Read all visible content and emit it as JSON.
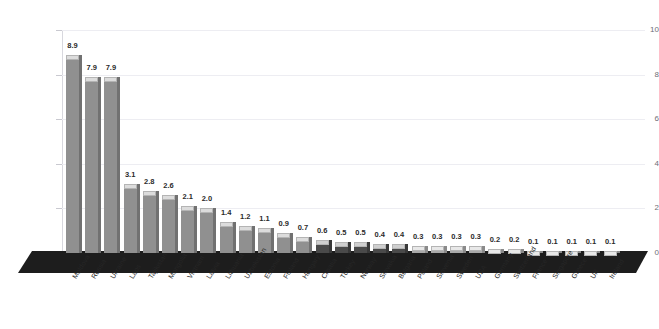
{
  "chart_data": {
    "type": "bar",
    "title": "",
    "subtitle": "",
    "xlabel": "",
    "ylabel": "",
    "ylim": [
      0,
      10
    ],
    "ytick_labels": [
      "0",
      "2",
      "4",
      "6",
      "8",
      "10"
    ],
    "ytick_values": [
      0,
      2,
      4,
      6,
      8,
      10
    ],
    "grid": true,
    "legend": "none",
    "style": "3d-isometric-column",
    "categories": [
      "Moldova",
      "Russia",
      "Ukraine",
      "Laos",
      "Tajikistan",
      "Mongolia",
      "Vietnam",
      "Latvia",
      "Lithuania",
      "Uzbekistan",
      "Estonia",
      "Finland",
      "Hungary",
      "Croatia",
      "Turkey",
      "Norway",
      "Slovakia",
      "Bulgaria",
      "Poland",
      "Slovenia",
      "Sweden",
      "USA",
      "Germany",
      "Switzerland",
      "France",
      "Singapore",
      "Greece",
      "UK",
      "Ireland"
    ],
    "values": [
      8.9,
      7.9,
      7.9,
      3.1,
      2.8,
      2.6,
      2.1,
      2.0,
      1.4,
      1.2,
      1.1,
      0.9,
      0.7,
      0.6,
      0.5,
      0.5,
      0.4,
      0.4,
      0.3,
      0.3,
      0.3,
      0.3,
      0.2,
      0.2,
      0.1,
      0.1,
      0.1,
      0.1,
      0.1
    ],
    "value_labels": [
      "8.9",
      "7.9",
      "7.9",
      "3.1",
      "2.8",
      "2.6",
      "2.1",
      "2.0",
      "1.4",
      "1.2",
      "1.1",
      "0.9",
      "0.7",
      "0.6",
      "0.5",
      "0.5",
      "0.4",
      "0.4",
      "0.3",
      "0.3",
      "0.3",
      "0.3",
      "0.2",
      "0.2",
      "0.1",
      "0.1",
      "0.1",
      "0.1",
      "0.1"
    ],
    "series": [
      {
        "name": "value",
        "values": [
          8.9,
          7.9,
          7.9,
          3.1,
          2.8,
          2.6,
          2.1,
          2.0,
          1.4,
          1.2,
          1.1,
          0.9,
          0.7,
          0.6,
          0.5,
          0.5,
          0.4,
          0.4,
          0.3,
          0.3,
          0.3,
          0.3,
          0.2,
          0.2,
          0.1,
          0.1,
          0.1,
          0.1,
          0.1
        ]
      }
    ],
    "colors": {
      "bar_light": "#a9a9a9",
      "bar_medium": "#909090",
      "bar_dark": "#4a4a4a",
      "bar_top": "#dcdcdc",
      "platform": "#1d1d1d",
      "gridline": "#ededf2",
      "axis": "#d8d8de",
      "tick_text": "#6e6e76",
      "value_text": "#2b2b2b",
      "background": "#ffffff"
    }
  }
}
